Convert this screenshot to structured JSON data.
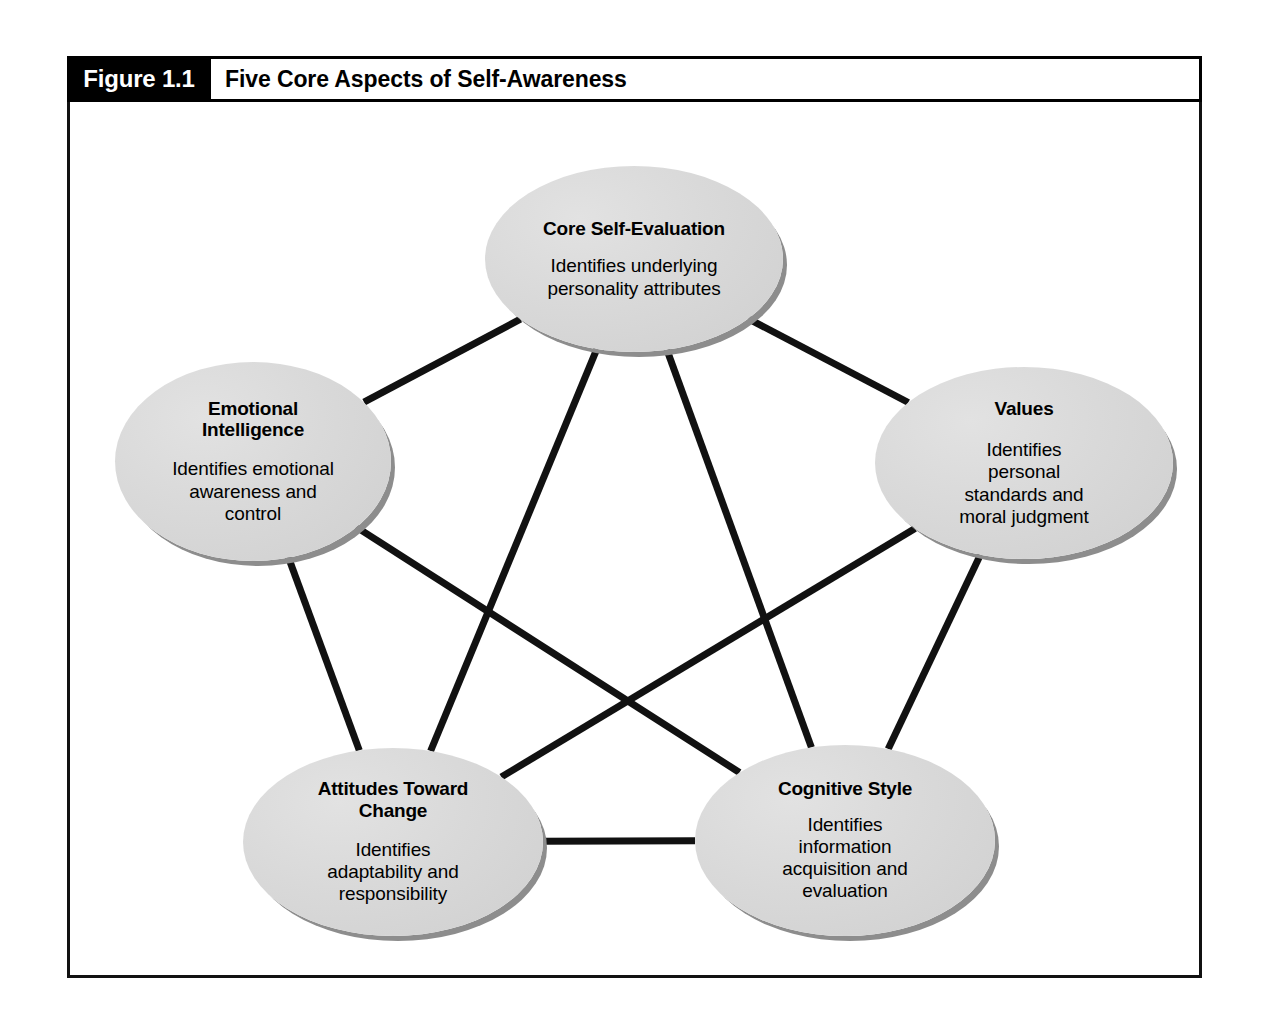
{
  "figure": {
    "number": "Figure 1.1",
    "title": "Five Core Aspects of Self-Awareness"
  },
  "colors": {
    "header_background": "#000000",
    "header_number_text": "#ffffff",
    "title_text": "#000000",
    "frame_border": "#111111",
    "node_fill": "#d9d9d9",
    "node_shadow": "#8d8d8d",
    "connector_line": "#111111",
    "page_background": "#ffffff"
  },
  "diagram": {
    "type": "network",
    "layout": "pentagon",
    "nodes": [
      {
        "id": "core-self-evaluation",
        "title": "Core Self-Evaluation",
        "description": "Identifies underlying\npersonality attributes",
        "desc_lines": [
          "Identifies underlying",
          "personality attributes"
        ],
        "cx": 634,
        "cy": 259,
        "rx": 149,
        "ry": 93
      },
      {
        "id": "emotional-intelligence",
        "title": "Emotional\nIntelligence",
        "title_lines": [
          "Emotional",
          "Intelligence"
        ],
        "description": "Identifies emotional\nawareness and\ncontrol",
        "desc_lines": [
          "Identifies emotional",
          "awareness and",
          "control"
        ],
        "cx": 253,
        "cy": 461,
        "rx": 138,
        "ry": 99
      },
      {
        "id": "values",
        "title": "Values",
        "title_lines": [
          "Values"
        ],
        "description": "Identifies\npersonal\nstandards and\nmoral judgment",
        "desc_lines": [
          "Identifies",
          "personal",
          "standards and",
          "moral judgment"
        ],
        "cx": 1024,
        "cy": 463,
        "rx": 149,
        "ry": 96
      },
      {
        "id": "attitudes-toward-change",
        "title": "Attitudes Toward\nChange",
        "title_lines": [
          "Attitudes Toward",
          "Change"
        ],
        "description": "Identifies\nadaptability and\nresponsibility",
        "desc_lines": [
          "Identifies",
          "adaptability and",
          "responsibility"
        ],
        "cx": 393,
        "cy": 842,
        "rx": 150,
        "ry": 94
      },
      {
        "id": "cognitive-style",
        "title": "Cognitive Style",
        "title_lines": [
          "Cognitive Style"
        ],
        "description": "Identifies\ninformation\nacquisition and\nevaluation",
        "desc_lines": [
          "Identifies",
          "information",
          "acquisition and",
          "evaluation"
        ],
        "cx": 845,
        "cy": 840,
        "rx": 150,
        "ry": 95
      }
    ],
    "edges": [
      {
        "from": "core-self-evaluation",
        "to": "emotional-intelligence"
      },
      {
        "from": "core-self-evaluation",
        "to": "values"
      },
      {
        "from": "core-self-evaluation",
        "to": "attitudes-toward-change"
      },
      {
        "from": "core-self-evaluation",
        "to": "cognitive-style"
      },
      {
        "from": "emotional-intelligence",
        "to": "values"
      },
      {
        "from": "emotional-intelligence",
        "to": "attitudes-toward-change"
      },
      {
        "from": "emotional-intelligence",
        "to": "cognitive-style"
      },
      {
        "from": "values",
        "to": "attitudes-toward-change"
      },
      {
        "from": "values",
        "to": "cognitive-style"
      },
      {
        "from": "attitudes-toward-change",
        "to": "cognitive-style"
      }
    ],
    "edge_note": "Every node connects to every other node (complete graph of five)",
    "edge_visible": [
      {
        "from": "core-self-evaluation",
        "to": "emotional-intelligence"
      },
      {
        "from": "core-self-evaluation",
        "to": "values"
      },
      {
        "from": "core-self-evaluation",
        "to": "attitudes-toward-change"
      },
      {
        "from": "core-self-evaluation",
        "to": "cognitive-style"
      },
      {
        "from": "emotional-intelligence",
        "to": "attitudes-toward-change"
      },
      {
        "from": "emotional-intelligence",
        "to": "cognitive-style"
      },
      {
        "from": "values",
        "to": "attitudes-toward-change"
      },
      {
        "from": "values",
        "to": "cognitive-style"
      },
      {
        "from": "attitudes-toward-change",
        "to": "cognitive-style"
      }
    ]
  }
}
